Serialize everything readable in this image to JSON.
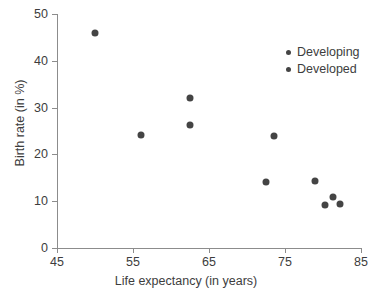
{
  "chart_data": {
    "type": "scatter",
    "title": "",
    "xlabel": "Life expectancy (in years)",
    "ylabel": "Birth rate (in %)",
    "xlim": [
      45,
      85
    ],
    "ylim": [
      0,
      50
    ],
    "xticks": [
      45,
      55,
      65,
      75,
      85
    ],
    "yticks": [
      0,
      10,
      20,
      30,
      40,
      50
    ],
    "grid": false,
    "legend_position": "top-right",
    "marker_color": "#444444",
    "axis_color": "#8c8c8c",
    "text_color": "#3d3d3d",
    "series": [
      {
        "name": "Developing",
        "color": "#444444",
        "points": [
          {
            "x": 50.0,
            "y": 46.0
          },
          {
            "x": 56.0,
            "y": 24.2
          },
          {
            "x": 62.5,
            "y": 32.0
          },
          {
            "x": 62.5,
            "y": 26.3
          },
          {
            "x": 73.5,
            "y": 24.0
          }
        ]
      },
      {
        "name": "Developed",
        "color": "#444444",
        "points": [
          {
            "x": 72.5,
            "y": 14.0
          },
          {
            "x": 79.0,
            "y": 14.3
          },
          {
            "x": 80.3,
            "y": 9.2
          },
          {
            "x": 81.3,
            "y": 10.8
          },
          {
            "x": 82.3,
            "y": 9.3
          }
        ]
      }
    ]
  },
  "legend": {
    "items": [
      {
        "label": "Developing"
      },
      {
        "label": "Developed"
      }
    ]
  }
}
